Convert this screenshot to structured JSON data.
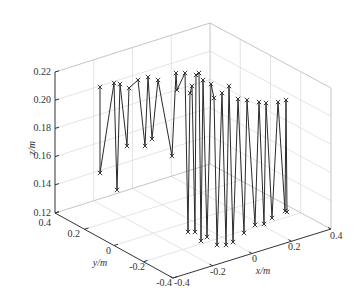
{
  "chart_data": {
    "type": "line",
    "subtype": "3d-line-with-markers",
    "title": "",
    "xlabel": "x/m",
    "ylabel": "y/m",
    "zlabel": "z/m",
    "xlim": [
      -0.4,
      0.4
    ],
    "ylim": [
      -0.4,
      0.4
    ],
    "zlim": [
      0.12,
      0.22
    ],
    "xticks": [
      "-0.4",
      "-0.2",
      "0",
      "0.2",
      "0.4"
    ],
    "yticks": [
      "0.4",
      "0.2",
      "0",
      "-0.2",
      "-0.4"
    ],
    "zticks": [
      "0.22",
      "0.20",
      "0.18",
      "0.16",
      "0.14",
      "0.12"
    ],
    "grid": true,
    "marker": "x",
    "line_color": "#2a2a2a",
    "note": "Trajectory of points alternating between high (~0.19-0.21 m) and low (~0.12-0.15 m) z levels; screen coordinates of markers listed in path order.",
    "screen_path": [
      [
        100,
        87
      ],
      [
        100,
        173
      ],
      [
        114,
        83
      ],
      [
        117,
        190
      ],
      [
        120,
        84
      ],
      [
        127,
        146
      ],
      [
        129,
        88
      ],
      [
        138,
        80
      ],
      [
        145,
        146
      ],
      [
        148,
        77
      ],
      [
        152,
        139
      ],
      [
        158,
        80
      ],
      [
        172,
        156
      ],
      [
        176,
        73
      ],
      [
        177,
        90
      ],
      [
        185,
        73
      ],
      [
        188,
        232
      ],
      [
        190,
        93
      ],
      [
        192,
        86
      ],
      [
        195,
        232
      ],
      [
        196,
        75
      ],
      [
        199,
        73
      ],
      [
        201,
        241
      ],
      [
        203,
        80
      ],
      [
        207,
        237
      ],
      [
        211,
        84
      ],
      [
        214,
        98
      ],
      [
        217,
        245
      ],
      [
        222,
        93
      ],
      [
        226,
        245
      ],
      [
        229,
        86
      ],
      [
        233,
        242
      ],
      [
        238,
        99
      ],
      [
        244,
        233
      ],
      [
        247,
        100
      ],
      [
        255,
        225
      ],
      [
        259,
        102
      ],
      [
        264,
        224
      ],
      [
        266,
        103
      ],
      [
        272,
        218
      ],
      [
        278,
        102
      ],
      [
        285,
        211
      ],
      [
        286,
        100
      ],
      [
        287,
        212
      ]
    ]
  },
  "labels": {
    "x_axis": "x/m",
    "y_axis": "y/m",
    "z_axis": "z/m"
  }
}
